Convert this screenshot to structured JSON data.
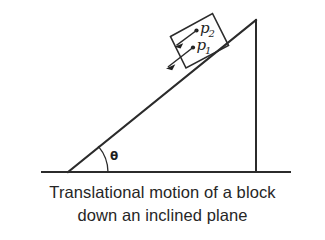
{
  "figure": {
    "background_color": "#ffffff",
    "ink_color": "#2b2b2b",
    "caption": {
      "line1": "Translational motion of a block",
      "line2": "down an inclined plane"
    },
    "labels": {
      "angle": "θ",
      "vector_upper_base": "p",
      "vector_upper_sub": "2",
      "vector_lower_base": "p",
      "vector_lower_sub": "1"
    },
    "geometry": {
      "ground_y": 172,
      "ground_x_start": 42,
      "ground_x_end": 290,
      "incline_base_x": 68,
      "apex_x": 255,
      "apex_y": 20,
      "angle_degrees": 39
    }
  }
}
